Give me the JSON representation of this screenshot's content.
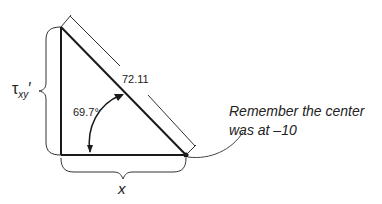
{
  "diagram": {
    "type": "right-triangle-mohr-circle",
    "hypotenuse_label": "72.11",
    "angle_label": "69.7°",
    "vertical_side_label": {
      "symbol": "τ",
      "subscript": "xy",
      "prime": "′"
    },
    "horizontal_side_label": "x",
    "callout": {
      "line1": "Remember the center",
      "line2": "was at –10"
    },
    "colors": {
      "line": "#1a1a1a",
      "text": "#222222",
      "background": "#ffffff"
    }
  }
}
